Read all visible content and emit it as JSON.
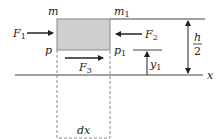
{
  "diagram": {
    "element": {
      "top_left": "m",
      "top_right": "m",
      "top_right_sub": "1",
      "bottom_left": "p",
      "bottom_right": "p",
      "bottom_right_sub": "1",
      "fill": "#cfcfcf"
    },
    "forces": [
      {
        "name": "F",
        "sub": "1",
        "direction": "right"
      },
      {
        "name": "F",
        "sub": "2",
        "direction": "left"
      },
      {
        "name": "F",
        "sub": "3",
        "direction": "right"
      }
    ],
    "dimensions": {
      "height_num": "h",
      "height_den": "2",
      "y_label": "y",
      "y_sub": "1",
      "width_label": "dx",
      "axis_label": "x"
    }
  }
}
